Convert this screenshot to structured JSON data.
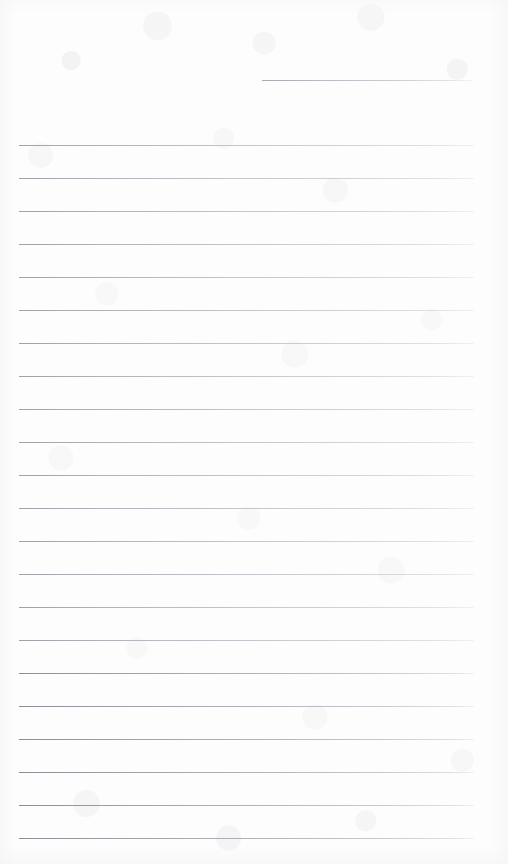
{
  "document": {
    "kind": "scanned-blank-lined-notepaper",
    "page_width": 508,
    "page_height": 864,
    "background_color": "#fdfdfd",
    "line_color": "#b8bcc2",
    "line_color_strong": "#9ca0a8",
    "ruled_line_count": 23,
    "text_content": "",
    "notes": "Blank ruled page — no written or printed text is present anywhere on the sheet."
  },
  "ruling": {
    "left_margin_x": 19,
    "right_margin_x": 474,
    "line_spacing": 33.0,
    "first_full_line_y": 145,
    "last_full_line_y": 838,
    "lines": [
      {
        "id": "rule-0",
        "y": 80,
        "x": 262,
        "width": 211,
        "weight": "short"
      },
      {
        "id": "rule-1",
        "y": 145,
        "x": 19,
        "width": 455,
        "weight": "normal"
      },
      {
        "id": "rule-2",
        "y": 178,
        "x": 19,
        "width": 455,
        "weight": "normal"
      },
      {
        "id": "rule-3",
        "y": 211,
        "x": 19,
        "width": 455,
        "weight": "normal"
      },
      {
        "id": "rule-4",
        "y": 244,
        "x": 19,
        "width": 455,
        "weight": "normal"
      },
      {
        "id": "rule-5",
        "y": 277,
        "x": 19,
        "width": 455,
        "weight": "normal"
      },
      {
        "id": "rule-6",
        "y": 310,
        "x": 19,
        "width": 455,
        "weight": "normal"
      },
      {
        "id": "rule-7",
        "y": 343,
        "x": 19,
        "width": 455,
        "weight": "normal"
      },
      {
        "id": "rule-8",
        "y": 376,
        "x": 19,
        "width": 455,
        "weight": "normal"
      },
      {
        "id": "rule-9",
        "y": 409,
        "x": 19,
        "width": 455,
        "weight": "normal"
      },
      {
        "id": "rule-10",
        "y": 442,
        "x": 19,
        "width": 455,
        "weight": "normal"
      },
      {
        "id": "rule-11",
        "y": 475,
        "x": 19,
        "width": 455,
        "weight": "normal"
      },
      {
        "id": "rule-12",
        "y": 508,
        "x": 19,
        "width": 455,
        "weight": "normal"
      },
      {
        "id": "rule-13",
        "y": 541,
        "x": 19,
        "width": 455,
        "weight": "normal"
      },
      {
        "id": "rule-14",
        "y": 574,
        "x": 19,
        "width": 455,
        "weight": "normal"
      },
      {
        "id": "rule-15",
        "y": 607,
        "x": 19,
        "width": 455,
        "weight": "normal"
      },
      {
        "id": "rule-16",
        "y": 640,
        "x": 19,
        "width": 455,
        "weight": "normal"
      },
      {
        "id": "rule-17",
        "y": 673,
        "x": 19,
        "width": 455,
        "weight": "strong"
      },
      {
        "id": "rule-18",
        "y": 706,
        "x": 19,
        "width": 455,
        "weight": "strong"
      },
      {
        "id": "rule-19",
        "y": 739,
        "x": 19,
        "width": 455,
        "weight": "strong"
      },
      {
        "id": "rule-20",
        "y": 772,
        "x": 19,
        "width": 455,
        "weight": "strong"
      },
      {
        "id": "rule-21",
        "y": 805,
        "x": 19,
        "width": 455,
        "weight": "strong"
      },
      {
        "id": "rule-22",
        "y": 838,
        "x": 19,
        "width": 455,
        "weight": "strong"
      }
    ]
  }
}
